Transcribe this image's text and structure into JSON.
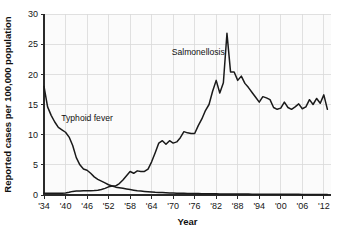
{
  "chart_data": {
    "type": "line",
    "title": "",
    "xlabel": "Year",
    "ylabel": "Reported cases per 100,000 population",
    "xlim": [
      1934,
      2014
    ],
    "ylim": [
      0,
      30
    ],
    "grid": true,
    "legend": "inline-annotations",
    "y_ticks": [
      0,
      5,
      10,
      15,
      20,
      25,
      30
    ],
    "y_tick_labels": [
      "0",
      "5",
      "10",
      "15",
      "20",
      "25",
      "30"
    ],
    "x_ticks": [
      1934,
      1940,
      1946,
      1952,
      1958,
      1964,
      1970,
      1976,
      1982,
      1988,
      1994,
      2000,
      2006,
      2012
    ],
    "x_tick_labels": [
      "'34",
      "'40",
      "'46",
      "'52",
      "'58",
      "'64",
      "'70",
      "'76",
      "'82",
      "'88",
      "'94",
      "'00",
      "'06",
      "'12"
    ],
    "annotations": [
      {
        "text": "Salmonellosis",
        "x": 1977,
        "y": 23.2
      },
      {
        "text": "Typhoid fever",
        "x": 1946,
        "y": 12.2
      }
    ],
    "series": [
      {
        "name": "Typhoid fever",
        "color": "#1a1a1a",
        "x": [
          1934,
          1935,
          1936,
          1937,
          1938,
          1939,
          1940,
          1941,
          1942,
          1943,
          1944,
          1945,
          1946,
          1947,
          1948,
          1949,
          1950,
          1951,
          1952,
          1953,
          1954,
          1955,
          1956,
          1957,
          1958,
          1959,
          1960,
          1961,
          1962,
          1963,
          1964,
          1965,
          1966,
          1967,
          1968,
          1969,
          1970,
          1971,
          1972,
          1973,
          1974,
          1975,
          1976,
          1977,
          1978,
          1979,
          1980,
          1981,
          1982,
          1983,
          1984,
          1985,
          1986,
          1987,
          1988,
          1989,
          1990,
          1991,
          1992,
          1993,
          1994,
          1995,
          1996,
          1997,
          1998,
          1999,
          2000,
          2001,
          2002,
          2003,
          2004,
          2005,
          2006,
          2007,
          2008,
          2009,
          2010,
          2011,
          2012,
          2013
        ],
        "values": [
          18.0,
          14.6,
          13.2,
          12.1,
          11.2,
          10.8,
          10.4,
          9.6,
          8.2,
          6.2,
          5.0,
          4.3,
          4.1,
          3.6,
          3.0,
          2.6,
          2.3,
          2.0,
          1.7,
          1.5,
          1.3,
          1.2,
          1.1,
          1.0,
          0.9,
          0.8,
          0.7,
          0.65,
          0.6,
          0.55,
          0.5,
          0.45,
          0.42,
          0.4,
          0.38,
          0.35,
          0.33,
          0.3,
          0.28,
          0.27,
          0.26,
          0.25,
          0.24,
          0.23,
          0.22,
          0.21,
          0.2,
          0.2,
          0.19,
          0.18,
          0.18,
          0.17,
          0.17,
          0.16,
          0.16,
          0.15,
          0.15,
          0.15,
          0.14,
          0.14,
          0.14,
          0.13,
          0.13,
          0.13,
          0.12,
          0.12,
          0.12,
          0.12,
          0.11,
          0.11,
          0.11,
          0.11,
          0.1,
          0.1,
          0.1,
          0.1,
          0.1,
          0.1,
          0.1,
          0.1
        ]
      },
      {
        "name": "Salmonellosis",
        "color": "#1a1a1a",
        "x": [
          1934,
          1935,
          1936,
          1937,
          1938,
          1939,
          1940,
          1941,
          1942,
          1943,
          1944,
          1945,
          1946,
          1947,
          1948,
          1949,
          1950,
          1951,
          1952,
          1953,
          1954,
          1955,
          1956,
          1957,
          1958,
          1959,
          1960,
          1961,
          1962,
          1963,
          1964,
          1965,
          1966,
          1967,
          1968,
          1969,
          1970,
          1971,
          1972,
          1973,
          1974,
          1975,
          1976,
          1977,
          1978,
          1979,
          1980,
          1981,
          1982,
          1983,
          1984,
          1985,
          1986,
          1987,
          1988,
          1989,
          1990,
          1991,
          1992,
          1993,
          1994,
          1995,
          1996,
          1997,
          1998,
          1999,
          2000,
          2001,
          2002,
          2003,
          2004,
          2005,
          2006,
          2007,
          2008,
          2009,
          2010,
          2011,
          2012,
          2013
        ],
        "values": [
          0.3,
          0.3,
          0.3,
          0.3,
          0.3,
          0.3,
          0.35,
          0.45,
          0.6,
          0.65,
          0.65,
          0.7,
          0.7,
          0.72,
          0.75,
          0.8,
          0.9,
          1.1,
          1.35,
          1.5,
          1.5,
          1.9,
          2.5,
          3.2,
          3.9,
          3.6,
          4.0,
          3.9,
          3.9,
          4.3,
          5.5,
          7.0,
          8.6,
          9.0,
          8.4,
          9.0,
          8.6,
          8.8,
          9.5,
          10.5,
          10.3,
          10.2,
          10.2,
          11.5,
          12.6,
          14.0,
          15.0,
          17.2,
          19.0,
          16.9,
          18.6,
          26.8,
          20.4,
          20.4,
          19.0,
          19.7,
          18.5,
          17.8,
          17.0,
          16.2,
          15.4,
          16.3,
          16.1,
          15.8,
          14.5,
          14.2,
          14.4,
          15.4,
          14.5,
          14.2,
          14.6,
          15.1,
          14.3,
          14.6,
          15.8,
          15.0,
          16.0,
          15.2,
          16.6,
          14.2
        ]
      }
    ]
  }
}
